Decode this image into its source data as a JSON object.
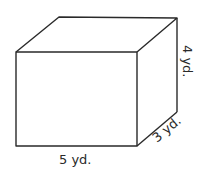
{
  "figure": {
    "shape": "rectangular prism",
    "dimensions": {
      "length": {
        "value": 5,
        "unit": "yd.",
        "label": "5 yd."
      },
      "width": {
        "value": 3,
        "unit": "yd.",
        "label": "3 yd."
      },
      "height": {
        "value": 4,
        "unit": "yd.",
        "label": "4 yd."
      }
    },
    "stroke_color": "#2a2a2a",
    "background": "#ffffff"
  }
}
